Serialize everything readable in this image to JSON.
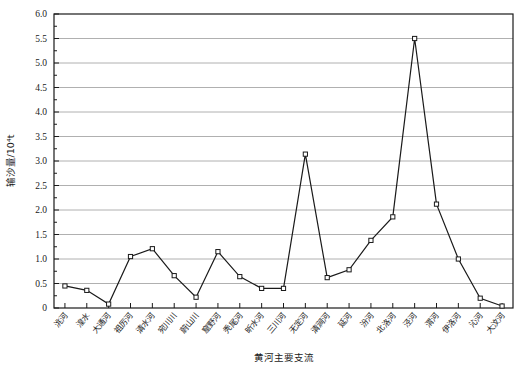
{
  "chart_data": {
    "type": "line",
    "title": "",
    "xlabel": "黄河主要支流",
    "ylabel": "输沙量/10⁴t",
    "ylim": [
      0,
      6.0
    ],
    "ytick_step": 0.5,
    "minor_ticks": true,
    "grid": "horizontal",
    "legend": "none",
    "marker": "open-square",
    "line_color": "#1a1a1a",
    "grid_color": "#b0b0b0",
    "frame_color": "#1a1a1a",
    "ytick_labels": [
      "0",
      "0.5",
      "1.0",
      "1.5",
      "2.0",
      "2.5",
      "3.0",
      "3.5",
      "4.0",
      "4.5",
      "5.0",
      "5.5",
      "6.0"
    ],
    "ytick_values": [
      0,
      0.5,
      1.0,
      1.5,
      2.0,
      2.5,
      3.0,
      3.5,
      4.0,
      4.5,
      5.0,
      5.5,
      6.0
    ],
    "categories": [
      "洮河",
      "湟水",
      "大通河",
      "祖厉河",
      "清水河",
      "宛川川",
      "蔚山川",
      "窟野河",
      "秃尾河",
      "昕水河",
      "三川河",
      "无定河",
      "清涧河",
      "延河",
      "汾河",
      "北洛河",
      "泾河",
      "渭河",
      "伊洛河",
      "沁河",
      "大汶河"
    ],
    "values": [
      0.45,
      0.36,
      0.08,
      1.05,
      1.21,
      0.66,
      0.22,
      1.15,
      0.64,
      0.4,
      0.4,
      3.14,
      0.62,
      0.78,
      1.38,
      1.86,
      5.5,
      2.12,
      1.0,
      0.2,
      0.04
    ]
  }
}
